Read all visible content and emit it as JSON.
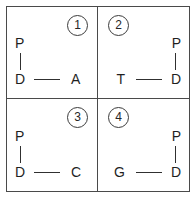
{
  "figure": {
    "border_color": "#4a4a4a",
    "background": "#ffffff",
    "text_color": "#1f1f1f"
  },
  "panels": [
    {
      "index_label": "1",
      "badge_position": "right",
      "motif_alignment": "left",
      "top_atom": "P",
      "hub_atom": "D",
      "terminal_atom": "A"
    },
    {
      "index_label": "2",
      "badge_position": "left",
      "motif_alignment": "right",
      "top_atom": "P",
      "hub_atom": "D",
      "terminal_atom": "T"
    },
    {
      "index_label": "3",
      "badge_position": "right",
      "motif_alignment": "left",
      "top_atom": "P",
      "hub_atom": "D",
      "terminal_atom": "C"
    },
    {
      "index_label": "4",
      "badge_position": "left",
      "motif_alignment": "right",
      "top_atom": "P",
      "hub_atom": "D",
      "terminal_atom": "G"
    }
  ]
}
